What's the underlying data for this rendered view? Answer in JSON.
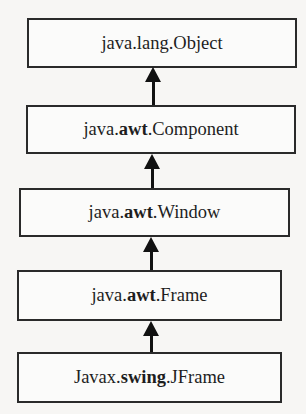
{
  "diagram": {
    "type": "class-inheritance-hierarchy",
    "nodes": [
      {
        "id": "object",
        "prefix": "java.",
        "bold": "",
        "sep": "",
        "suffix": "lang.Object"
      },
      {
        "id": "component",
        "prefix": "java.",
        "bold": "awt",
        "sep": ".",
        "suffix": "Component"
      },
      {
        "id": "window",
        "prefix": "java.",
        "bold": "awt",
        "sep": ".",
        "suffix": "Window"
      },
      {
        "id": "frame",
        "prefix": "java.",
        "bold": "awt",
        "sep": ".",
        "suffix": "Frame"
      },
      {
        "id": "jframe",
        "prefix": "Javax.",
        "bold": "swing",
        "sep": ".",
        "suffix": "JFrame"
      }
    ],
    "edges": [
      {
        "from": "component",
        "to": "object",
        "style": "arrow-up"
      },
      {
        "from": "window",
        "to": "component",
        "style": "arrow-up"
      },
      {
        "from": "frame",
        "to": "window",
        "style": "arrow-up"
      },
      {
        "from": "jframe",
        "to": "frame",
        "style": "arrow-up"
      }
    ],
    "colors": {
      "background": "#f7f6f4",
      "box_border": "#2a2a2a",
      "text": "#1e1e1e",
      "arrow": "#111111"
    }
  }
}
